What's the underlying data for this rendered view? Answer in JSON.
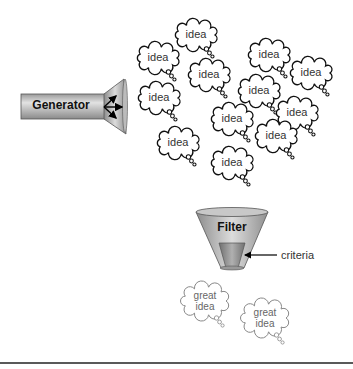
{
  "generator": {
    "label": "Generator"
  },
  "ideas": [
    {
      "label": "idea",
      "x": 196,
      "y": 35
    },
    {
      "label": "idea",
      "x": 158,
      "y": 58
    },
    {
      "label": "idea",
      "x": 269,
      "y": 55
    },
    {
      "label": "idea",
      "x": 209,
      "y": 75
    },
    {
      "label": "idea",
      "x": 311,
      "y": 73
    },
    {
      "label": "idea",
      "x": 159,
      "y": 98
    },
    {
      "label": "idea",
      "x": 259,
      "y": 91
    },
    {
      "label": "idea",
      "x": 297,
      "y": 113
    },
    {
      "label": "idea",
      "x": 232,
      "y": 119
    },
    {
      "label": "idea",
      "x": 276,
      "y": 136
    },
    {
      "label": "idea",
      "x": 178,
      "y": 143
    },
    {
      "label": "idea",
      "x": 232,
      "y": 163
    }
  ],
  "filter": {
    "label": "Filter",
    "criteria_label": "criteria"
  },
  "great_ideas": [
    {
      "line1": "great",
      "line2": "idea",
      "x": 205,
      "y": 301
    },
    {
      "line1": "great",
      "line2": "idea",
      "x": 265,
      "y": 318
    }
  ]
}
